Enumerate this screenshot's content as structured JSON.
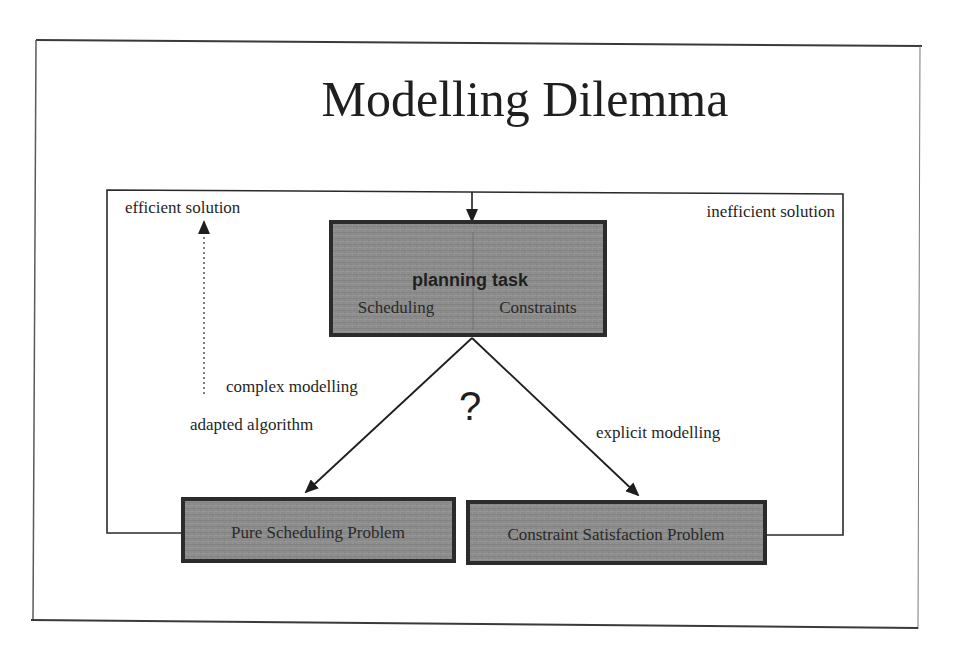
{
  "slide": {
    "title": "Modelling Dilemma"
  },
  "diagram": {
    "nodes": {
      "planning_task": {
        "title": "planning task",
        "left_label": "Scheduling",
        "right_label": "Constraints"
      },
      "pure_scheduling": {
        "label": "Pure Scheduling Problem"
      },
      "constraint_satisfaction": {
        "label": "Constraint Satisfaction Problem"
      }
    },
    "labels": {
      "efficient": "efficient solution",
      "inefficient": "inefficient solution",
      "complex_modelling": "complex modelling",
      "adapted_algorithm": "adapted algorithm",
      "explicit_modelling": "explicit modelling",
      "question_mark": "?"
    },
    "edges": [
      {
        "from": "planning_task",
        "to": "pure_scheduling",
        "label": "complex modelling"
      },
      {
        "from": "planning_task",
        "to": "constraint_satisfaction",
        "label": "explicit modelling"
      },
      {
        "from": "pure_scheduling",
        "to": "planning_task",
        "style": "feedback loop"
      },
      {
        "from": "constraint_satisfaction",
        "to": "planning_task",
        "style": "feedback loop"
      }
    ]
  },
  "colors": {
    "box_fill": "#8a8a8a",
    "box_border": "#2b2b2b",
    "line": "#2a2a2a",
    "text": "#1f1f1f"
  }
}
